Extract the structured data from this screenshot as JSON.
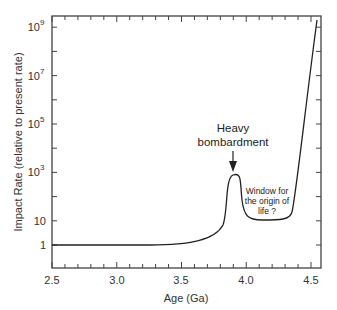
{
  "chart_data": {
    "type": "line",
    "title": "",
    "xlabel": "Age (Ga)",
    "ylabel": "Impact Rate (relative to present rate)",
    "xlim": [
      2.5,
      4.55
    ],
    "ylim_log10": [
      -0.5,
      9.5
    ],
    "yscale": "log",
    "grid": false,
    "x_ticks": [
      "2.5",
      "3.0",
      "3.5",
      "4.0",
      "4.5"
    ],
    "y_ticks": [
      {
        "label": "1",
        "log10": 0
      },
      {
        "label": "10",
        "log10": 1
      },
      {
        "label": "10",
        "sup": "3",
        "log10": 3
      },
      {
        "label": "10",
        "sup": "5",
        "log10": 5
      },
      {
        "label": "10",
        "sup": "7",
        "log10": 7
      },
      {
        "label": "10",
        "sup": "9",
        "log10": 9
      }
    ],
    "series": [
      {
        "name": "Impact rate",
        "points_age_log10": [
          [
            2.5,
            0
          ],
          [
            3.0,
            0
          ],
          [
            3.3,
            0
          ],
          [
            3.45,
            0.1
          ],
          [
            3.6,
            0.3
          ],
          [
            3.7,
            0.6
          ],
          [
            3.76,
            1.0
          ],
          [
            3.8,
            1.6
          ],
          [
            3.83,
            2.4
          ],
          [
            3.86,
            2.75
          ],
          [
            3.9,
            2.85
          ],
          [
            3.94,
            2.75
          ],
          [
            3.96,
            2.3
          ],
          [
            3.98,
            1.6
          ],
          [
            4.02,
            1.2
          ],
          [
            4.1,
            1.05
          ],
          [
            4.2,
            1.05
          ],
          [
            4.3,
            1.2
          ],
          [
            4.35,
            1.6
          ],
          [
            4.4,
            3.5
          ],
          [
            4.45,
            5.5
          ],
          [
            4.5,
            7.7
          ],
          [
            4.54,
            9.4
          ]
        ]
      }
    ],
    "annotations": [
      {
        "text_lines": [
          "Heavy",
          "bombardment"
        ],
        "x": 3.9,
        "arrow_to_log10": 2.95
      },
      {
        "text_lines": [
          "Window for",
          "the origin of",
          "life ?"
        ],
        "x": 4.17,
        "log10": 1.8
      }
    ]
  },
  "axes": {
    "x_title": "Age (Ga)",
    "y_title": "Impact Rate (relative to present rate)",
    "x_labels": [
      "2.5",
      "3.0",
      "3.5",
      "4.0",
      "4.5"
    ],
    "y_labels": [
      {
        "base": "1",
        "exp": ""
      },
      {
        "base": "10",
        "exp": ""
      },
      {
        "base": "10",
        "exp": "3"
      },
      {
        "base": "10",
        "exp": "5"
      },
      {
        "base": "10",
        "exp": "7"
      },
      {
        "base": "10",
        "exp": "9"
      }
    ]
  },
  "annotations": {
    "heavy_line1": "Heavy",
    "heavy_line2": "bombardment",
    "window_line1": "Window for",
    "window_line2": "the origin of",
    "window_line3": "life ?"
  }
}
